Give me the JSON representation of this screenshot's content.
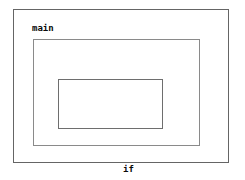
{
  "diagram": {
    "type": "nested-scope-boxes",
    "background_color": "#ffffff",
    "text_color": "#0a0a0a",
    "scopes": [
      {
        "id": "main",
        "keyword": "main",
        "border_color": "#656565",
        "declarations": [
          "int first,second;"
        ],
        "depth": 0
      },
      {
        "id": "while",
        "keyword": "while",
        "border_color": "#8a8a8a",
        "declarations": [
          "int second;"
        ],
        "depth": 1
      },
      {
        "id": "if",
        "keyword": "if",
        "border_color": "#6e6e6e",
        "declarations": [
          "int first;"
        ],
        "depth": 2
      }
    ]
  }
}
